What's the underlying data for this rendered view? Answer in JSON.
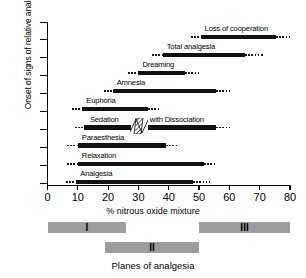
{
  "chart_data": {
    "type": "bar",
    "title": "",
    "xlabel": "% nitrous oxide mixture",
    "ylabel": "Onset of signs of relative analgesia",
    "xlim": [
      0,
      80
    ],
    "xticks": [
      0,
      10,
      20,
      30,
      40,
      50,
      60,
      70,
      80
    ],
    "grid": false,
    "legend": "none",
    "bars": [
      {
        "label": "Loss of cooperation",
        "dotted_start": 47.5,
        "solid_start": 50.5,
        "solid_end": 75.5,
        "dotted_end": 80.5,
        "label_align": "center"
      },
      {
        "label": "Total analgesia",
        "dotted_start": 34.5,
        "solid_start": 38.0,
        "solid_end": 65.0,
        "dotted_end": 71.0,
        "label_align": "center"
      },
      {
        "label": "Dreaming",
        "dotted_start": 26.5,
        "solid_start": 30.0,
        "solid_end": 45.5,
        "dotted_end": 50.5,
        "label_align": "center"
      },
      {
        "label": "Amnesia",
        "dotted_start": 18.5,
        "solid_start": 21.5,
        "solid_end": 55.5,
        "dotted_end": 60.5,
        "label_align": "center"
      },
      {
        "label": "Euphoria",
        "dotted_start": 8.0,
        "solid_start": 11.5,
        "solid_end": 33.0,
        "dotted_end": 37.0,
        "label_align": "center"
      },
      {
        "label": "Sedation",
        "label2": "with Dissociation",
        "dotted_start": 9.0,
        "solid_start": 12.0,
        "solid_end": 55.5,
        "dotted_end": 61.0,
        "break_at": 27.5,
        "label_align": "left"
      },
      {
        "label": "Paraesthesia",
        "dotted_start": 6.5,
        "solid_start": 10.0,
        "solid_end": 39.0,
        "dotted_end": 43.5,
        "label_align": "center"
      },
      {
        "label": "Relaxation",
        "dotted_start": 6.5,
        "solid_start": 10.0,
        "solid_end": 51.5,
        "dotted_end": 56.0,
        "label_align": "center"
      },
      {
        "label": "Analgesia",
        "dotted_start": 6.0,
        "solid_start": 9.5,
        "solid_end": 48.0,
        "dotted_end": 53.5,
        "label_align": "center"
      }
    ],
    "planes": {
      "title": "Planes of analgesia",
      "color": "#9d9d9d",
      "items": [
        {
          "label": "I",
          "start": 0,
          "end": 26,
          "row": 1
        },
        {
          "label": "III",
          "start": 50,
          "end": 80,
          "row": 1
        },
        {
          "label": "II",
          "start": 19,
          "end": 50,
          "row": 2
        }
      ]
    }
  }
}
